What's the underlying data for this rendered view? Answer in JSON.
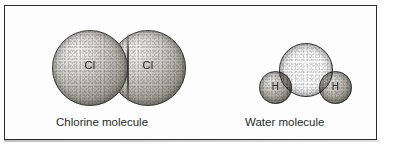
{
  "figure": {
    "frame": {
      "border_color": "#2b2b2b",
      "background_color": "#fdfdfd"
    },
    "molecules": [
      {
        "id": "chlorine",
        "caption": "Chlorine molecule",
        "atoms": [
          {
            "symbol": "Cl",
            "name": "chlorine-atom-left",
            "color": "#c3c0ba"
          },
          {
            "symbol": "Cl",
            "name": "chlorine-atom-right",
            "color": "#c3c0ba"
          }
        ]
      },
      {
        "id": "water",
        "caption": "Water molecule",
        "atoms": [
          {
            "symbol": "O",
            "name": "oxygen-atom",
            "color": "#45413a"
          },
          {
            "symbol": "H",
            "name": "hydrogen-atom-left",
            "color": "#b2aea6"
          },
          {
            "symbol": "H",
            "name": "hydrogen-atom-right",
            "color": "#b2aea6"
          }
        ]
      }
    ]
  }
}
